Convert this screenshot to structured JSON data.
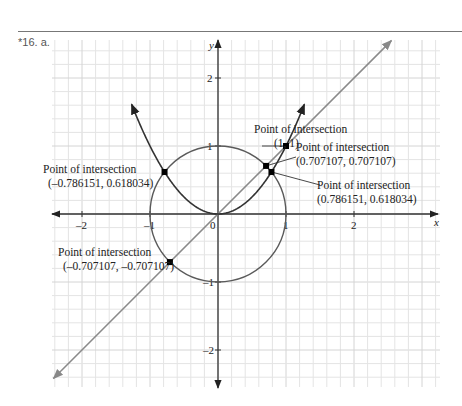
{
  "problem_label": "*16. a.",
  "chart_data": {
    "type": "line",
    "title": "",
    "xlabel": "x",
    "ylabel": "y",
    "xlim": [
      -2.45,
      3.25
    ],
    "ylim": [
      -2.55,
      2.55
    ],
    "grid": true,
    "x_ticks": [
      "-2",
      "-1",
      "0",
      "1",
      "2"
    ],
    "y_ticks": [
      "2",
      "1",
      "-1",
      "-2"
    ],
    "origin_label": "0",
    "series": [
      {
        "name": "y = x^2",
        "kind": "parabola",
        "color": "#333333"
      },
      {
        "name": "x^2 + y^2 = 1",
        "kind": "circle",
        "color": "#555555"
      },
      {
        "name": "y = x",
        "kind": "line",
        "color": "#888888"
      }
    ],
    "annotations": [
      {
        "title": "Point of intersection",
        "coords": "(1, 1)",
        "x": 1,
        "y": 1
      },
      {
        "title": "Point of intersection",
        "coords": "(0.707107, 0.707107)",
        "x": 0.707107,
        "y": 0.707107
      },
      {
        "title": "Point of intersection",
        "coords": "(0.786151, 0.618034)",
        "x": 0.786151,
        "y": 0.618034
      },
      {
        "title": "Point of intersection",
        "coords": "(–0.786151, 0.618034)",
        "x": -0.786151,
        "y": 0.618034
      },
      {
        "title": "Point of intersection",
        "coords": "(–0.707107, –0.707107)",
        "x": -0.707107,
        "y": -0.707107
      }
    ]
  }
}
